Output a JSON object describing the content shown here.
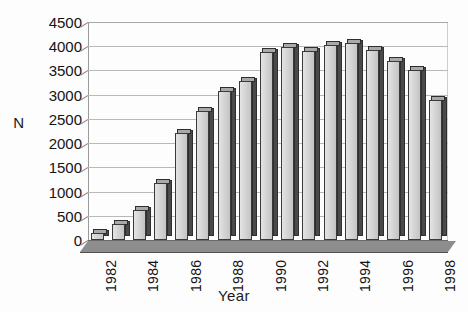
{
  "chart_data": {
    "type": "bar",
    "title": "",
    "xlabel": "Year",
    "ylabel": "N",
    "categories": [
      "1982",
      "1983",
      "1984",
      "1985",
      "1986",
      "1987",
      "1988",
      "1989",
      "1990",
      "1991",
      "1992",
      "1993",
      "1994",
      "1995",
      "1996",
      "1997",
      "1998"
    ],
    "values": [
      150,
      330,
      620,
      1180,
      2200,
      2670,
      3080,
      3280,
      3880,
      3980,
      3900,
      4030,
      4070,
      3930,
      3700,
      3500,
      2900
    ],
    "ylim": [
      0,
      4500
    ],
    "yticks": [
      0,
      500,
      1000,
      1500,
      2000,
      2500,
      3000,
      3500,
      4000,
      4500
    ],
    "ytick_labels": [
      "0",
      "500",
      "1000",
      "1500",
      "2000",
      "2500",
      "3000",
      "3500",
      "4000",
      "4500"
    ],
    "xtick_labels": [
      "1982",
      "",
      "1984",
      "",
      "1986",
      "",
      "1988",
      "",
      "1990",
      "",
      "1992",
      "",
      "1994",
      "",
      "1996",
      "",
      "1998"
    ],
    "grid": true,
    "legend": false,
    "legend_position": "none",
    "style": "3d-column",
    "bar_fill_color": "#d2d2d2",
    "bar_edge_color": "#3a3a3a",
    "bar_side_color": "#4a4a4a",
    "gridline_color": "#b9b9b9",
    "floor_color": "#8d8d8d",
    "background_color": "#ffffff"
  }
}
